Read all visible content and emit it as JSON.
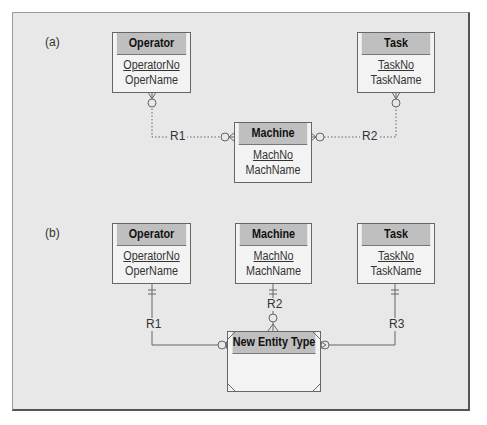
{
  "part_a": {
    "label": "(a)",
    "entities": {
      "operator": {
        "name": "Operator",
        "pk": "OperatorNo",
        "attr": "OperName"
      },
      "task": {
        "name": "Task",
        "pk": "TaskNo",
        "attr": "TaskName"
      },
      "machine": {
        "name": "Machine",
        "pk": "MachNo",
        "attr": "MachName"
      }
    },
    "relationships": {
      "r1": "R1",
      "r2": "R2"
    }
  },
  "part_b": {
    "label": "(b)",
    "entities": {
      "operator": {
        "name": "Operator",
        "pk": "OperatorNo",
        "attr": "OperName"
      },
      "machine": {
        "name": "Machine",
        "pk": "MachNo",
        "attr": "MachName"
      },
      "task": {
        "name": "Task",
        "pk": "TaskNo",
        "attr": "TaskName"
      },
      "new_entity": {
        "name": "New Entity Type"
      }
    },
    "relationships": {
      "r1": "R1",
      "r2": "R2",
      "r3": "R3"
    }
  },
  "colors": {
    "frame_bg": "#e8e8e8",
    "header_bg": "#bfbfbf",
    "entity_body": "#f3f3f3",
    "line": "#666666"
  }
}
